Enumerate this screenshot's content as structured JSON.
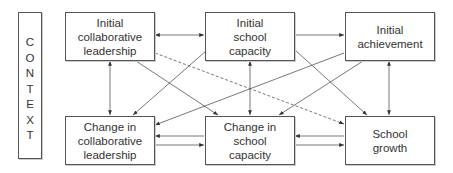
{
  "context": {
    "label": "CONTEXT",
    "letters": [
      "C",
      "O",
      "N",
      "T",
      "E",
      "X",
      "T"
    ]
  },
  "nodes": {
    "initial_collaborative_leadership": "Initial\ncollaborative\nleadership",
    "initial_school_capacity": "Initial\nschool\ncapacity",
    "initial_achievement": "Initial\nachievement",
    "change_collaborative_leadership": "Change in\ncollaborative\nleadership",
    "change_school_capacity": "Change in\nschool\ncapacity",
    "school_growth": "School\ngrowth"
  },
  "edges": [
    {
      "from": "Initial collaborative leadership",
      "to": "Initial school capacity",
      "style": "solid",
      "direction": "both"
    },
    {
      "from": "Initial school capacity",
      "to": "Initial achievement",
      "style": "solid",
      "direction": "forward"
    },
    {
      "from": "Initial collaborative leadership",
      "to": "Change in collaborative leadership",
      "style": "solid",
      "direction": "both"
    },
    {
      "from": "Initial school capacity",
      "to": "Change in school capacity",
      "style": "solid",
      "direction": "both"
    },
    {
      "from": "Initial achievement",
      "to": "School growth",
      "style": "solid",
      "direction": "both"
    },
    {
      "from": "Change in school capacity",
      "to": "Change in collaborative leadership",
      "style": "solid",
      "direction": "forward"
    },
    {
      "from": "Change in collaborative leadership",
      "to": "Change in school capacity",
      "style": "solid",
      "direction": "forward"
    },
    {
      "from": "School growth",
      "to": "Change in school capacity",
      "style": "solid",
      "direction": "forward"
    },
    {
      "from": "Change in school capacity",
      "to": "School growth",
      "style": "solid",
      "direction": "forward"
    },
    {
      "from": "Initial collaborative leadership",
      "to": "Change in school capacity",
      "style": "solid",
      "direction": "forward"
    },
    {
      "from": "Initial school capacity",
      "to": "Change in collaborative leadership",
      "style": "solid",
      "direction": "forward"
    },
    {
      "from": "Initial school capacity",
      "to": "School growth",
      "style": "solid",
      "direction": "forward"
    },
    {
      "from": "Initial achievement",
      "to": "Change in collaborative leadership",
      "style": "solid",
      "direction": "forward"
    },
    {
      "from": "Initial achievement",
      "to": "Change in school capacity",
      "style": "solid",
      "direction": "forward"
    },
    {
      "from": "Initial collaborative leadership",
      "to": "School growth",
      "style": "dashed",
      "direction": "forward"
    }
  ],
  "colors": {
    "line": "#444444",
    "border": "#555555",
    "text": "#333333",
    "background": "#ffffff"
  }
}
